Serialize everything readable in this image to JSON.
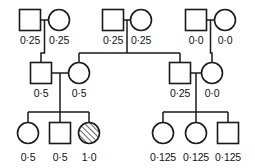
{
  "figure": {
    "width": 255,
    "height": 168,
    "background_color": "#ffffff",
    "line_color": "#1a1a1a",
    "text_color": "#111111",
    "decimal_separator": "·"
  },
  "chart_data": {
    "type": "diagram",
    "subtype": "pedigree",
    "title": "",
    "legend": [],
    "annotations": [],
    "symbols": {
      "square": "male",
      "circle": "female",
      "hatched": "affected"
    },
    "generations": [
      {
        "id": "I",
        "y": 20,
        "members": [
          {
            "id": "I-1",
            "sex": "male",
            "shape": "square",
            "cx": 30,
            "cy": 20,
            "affected": false,
            "value": "0·25",
            "label_x": 30,
            "label_y": 44
          },
          {
            "id": "I-2",
            "sex": "female",
            "shape": "circle",
            "cx": 59,
            "cy": 20,
            "affected": false,
            "value": "0·25",
            "label_x": 59,
            "label_y": 44
          },
          {
            "id": "I-3",
            "sex": "male",
            "shape": "square",
            "cx": 113,
            "cy": 20,
            "affected": false,
            "value": "0·25",
            "label_x": 113,
            "label_y": 44
          },
          {
            "id": "I-4",
            "sex": "female",
            "shape": "circle",
            "cx": 141,
            "cy": 20,
            "affected": false,
            "value": "0·25",
            "label_x": 141,
            "label_y": 44
          },
          {
            "id": "I-5",
            "sex": "male",
            "shape": "square",
            "cx": 196,
            "cy": 20,
            "affected": false,
            "value": "0·0",
            "label_x": 196,
            "label_y": 44
          },
          {
            "id": "I-6",
            "sex": "female",
            "shape": "circle",
            "cx": 225,
            "cy": 20,
            "affected": false,
            "value": "0·0",
            "label_x": 225,
            "label_y": 44
          }
        ]
      },
      {
        "id": "II",
        "y": 73,
        "members": [
          {
            "id": "II-1",
            "sex": "male",
            "shape": "square",
            "cx": 41,
            "cy": 73,
            "affected": false,
            "value": "0·5",
            "label_x": 41,
            "label_y": 97
          },
          {
            "id": "II-2",
            "sex": "female",
            "shape": "circle",
            "cx": 79,
            "cy": 73,
            "affected": false,
            "value": "0·5",
            "label_x": 79,
            "label_y": 97
          },
          {
            "id": "II-3",
            "sex": "male",
            "shape": "square",
            "cx": 180,
            "cy": 73,
            "affected": false,
            "value": "0·25",
            "label_x": 180,
            "label_y": 97
          },
          {
            "id": "II-4",
            "sex": "female",
            "shape": "circle",
            "cx": 212,
            "cy": 73,
            "affected": false,
            "value": "0·0",
            "label_x": 212,
            "label_y": 97
          }
        ]
      },
      {
        "id": "III",
        "y": 133,
        "members": [
          {
            "id": "III-1",
            "sex": "female",
            "shape": "circle",
            "cx": 28,
            "cy": 133,
            "affected": false,
            "value": "0·5",
            "label_x": 28,
            "label_y": 161
          },
          {
            "id": "III-2",
            "sex": "male",
            "shape": "square",
            "cx": 60,
            "cy": 133,
            "affected": false,
            "value": "0·5",
            "label_x": 60,
            "label_y": 161
          },
          {
            "id": "III-3",
            "sex": "female",
            "shape": "circle",
            "cx": 89,
            "cy": 133,
            "affected": true,
            "value": "1·0",
            "label_x": 89,
            "label_y": 161
          },
          {
            "id": "III-4",
            "sex": "female",
            "shape": "circle",
            "cx": 163,
            "cy": 133,
            "affected": false,
            "value": "0·125",
            "label_x": 163,
            "label_y": 161
          },
          {
            "id": "III-5",
            "sex": "female",
            "shape": "circle",
            "cx": 196,
            "cy": 133,
            "affected": false,
            "value": "0·125",
            "label_x": 196,
            "label_y": 161
          },
          {
            "id": "III-6",
            "sex": "male",
            "shape": "square",
            "cx": 228,
            "cy": 133,
            "affected": false,
            "value": "0·125",
            "label_x": 228,
            "label_y": 161
          }
        ]
      }
    ],
    "values_by_id": {
      "I-1": 0.25,
      "I-2": 0.25,
      "I-3": 0.25,
      "I-4": 0.25,
      "I-5": 0.0,
      "I-6": 0.0,
      "II-1": 0.5,
      "II-2": 0.5,
      "II-3": 0.25,
      "II-4": 0.0,
      "III-1": 0.5,
      "III-2": 0.5,
      "III-3": 1.0,
      "III-4": 0.125,
      "III-5": 0.125,
      "III-6": 0.125
    },
    "matings": [
      {
        "id": "mating-I-1-I-2",
        "partners": [
          "I-1",
          "I-2"
        ],
        "children": [
          "II-1"
        ]
      },
      {
        "id": "mating-I-3-I-4",
        "partners": [
          "I-3",
          "I-4"
        ],
        "children": [
          "II-2",
          "II-3"
        ]
      },
      {
        "id": "mating-I-5-I-6",
        "partners": [
          "I-5",
          "I-6"
        ],
        "children": [
          "II-4"
        ]
      },
      {
        "id": "mating-II-1-II-2",
        "partners": [
          "II-1",
          "II-2"
        ],
        "children": [
          "III-1",
          "III-2",
          "III-3"
        ]
      },
      {
        "id": "mating-II-3-II-4",
        "partners": [
          "II-3",
          "II-4"
        ],
        "children": [
          "III-4",
          "III-5",
          "III-6"
        ]
      }
    ]
  },
  "geometry": {
    "square_size": 21,
    "circle_radius": 10.5,
    "mating_lines": [
      {
        "id": "mating-line-1",
        "x1": 40.5,
        "y1": 20,
        "x2": 48.5,
        "y2": 20
      },
      {
        "id": "mating-line-2",
        "x1": 123.5,
        "y1": 20,
        "x2": 130.5,
        "y2": 20
      },
      {
        "id": "mating-line-3",
        "x1": 206.5,
        "y1": 20,
        "x2": 214.5,
        "y2": 20
      },
      {
        "id": "mating-line-4",
        "x1": 51.5,
        "y1": 73,
        "x2": 68.5,
        "y2": 73
      },
      {
        "id": "mating-line-5",
        "x1": 190.5,
        "y1": 73,
        "x2": 201.5,
        "y2": 73
      }
    ],
    "descent_paths": [
      {
        "id": "descent-I12-to-II1",
        "d": "M 44.5 20 L 44.5 53 L 41 53 L 41 62.5"
      },
      {
        "id": "descent-I34-to-sibs",
        "d": "M 127 20 L 127 53"
      },
      {
        "id": "sibship-bar-II",
        "d": "M 79 53 L 180 53"
      },
      {
        "id": "drop-II2",
        "d": "M 79 53 L 79 62.5"
      },
      {
        "id": "drop-II3",
        "d": "M 180 53 L 180 62.5"
      },
      {
        "id": "descent-I56-to-II4",
        "d": "M 210.5 20 L 210.5 53 L 212 53 L 212 62.5"
      },
      {
        "id": "descent-II12-drop",
        "d": "M 60 73 L 60 112"
      },
      {
        "id": "sibship-bar-III-left",
        "d": "M 28 112 L 89 112"
      },
      {
        "id": "drop-III1",
        "d": "M 28 112 L 28 122.5"
      },
      {
        "id": "drop-III2",
        "d": "M 60 112 L 60 122.5"
      },
      {
        "id": "drop-III3",
        "d": "M 89 112 L 89 122.5"
      },
      {
        "id": "descent-II34-drop",
        "d": "M 196 73 L 196 112"
      },
      {
        "id": "sibship-bar-III-right",
        "d": "M 163 112 L 228 112"
      },
      {
        "id": "drop-III4",
        "d": "M 163 112 L 163 122.5"
      },
      {
        "id": "drop-III5",
        "d": "M 196 112 L 196 122.5"
      },
      {
        "id": "drop-III6",
        "d": "M 228 112 L 228 122.5"
      }
    ]
  }
}
